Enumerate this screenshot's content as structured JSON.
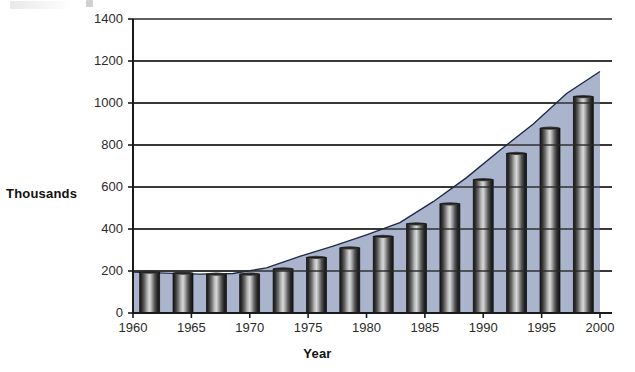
{
  "chart_data": {
    "type": "bar",
    "title": "",
    "subtitle": "",
    "xlabel": "Year",
    "ylabel": "Thousands",
    "xlim": [
      1960,
      2000
    ],
    "ylim": [
      0,
      1400
    ],
    "grid": true,
    "legend": "none",
    "y_ticks": [
      0,
      200,
      400,
      600,
      800,
      1000,
      1200,
      1400
    ],
    "y_tick_labels": [
      "0",
      "200",
      "400",
      "600",
      "800",
      "1000",
      "1200",
      "1400"
    ],
    "x_ticks": [
      1960,
      1965,
      1970,
      1975,
      1980,
      1985,
      1990,
      1995,
      2000
    ],
    "x_tick_labels": [
      "1960",
      "1965",
      "1970",
      "1975",
      "1980",
      "1985",
      "1990",
      "1995",
      "2000"
    ],
    "categories": [
      1960,
      1963,
      1966,
      1969,
      1972,
      1975,
      1978,
      1981,
      1984,
      1987,
      1990,
      1993,
      1996,
      1999
    ],
    "values": [
      195,
      190,
      185,
      185,
      210,
      265,
      310,
      365,
      425,
      520,
      635,
      760,
      880,
      1030
    ],
    "series": [
      {
        "name": "Thousands",
        "values": [
          195,
          190,
          185,
          185,
          210,
          265,
          310,
          365,
          425,
          520,
          635,
          760,
          880,
          1030
        ]
      }
    ],
    "area_outline": [
      195,
      190,
      185,
      188,
      215,
      270,
      318,
      372,
      430,
      530,
      645,
      775,
      900,
      1045,
      1150
    ],
    "end_value": 1150,
    "colors": {
      "area_fill": "#aab4cc",
      "bar_dark": "#1b1b1b",
      "bar_light": "#c8c8c8",
      "outline": "#1d2a4a",
      "gridline": "#2a2a2a",
      "axis": "#1a1a1a",
      "text": "#2b2b2b"
    }
  },
  "axis": {
    "y_title": "Thousands",
    "x_title": "Year"
  }
}
